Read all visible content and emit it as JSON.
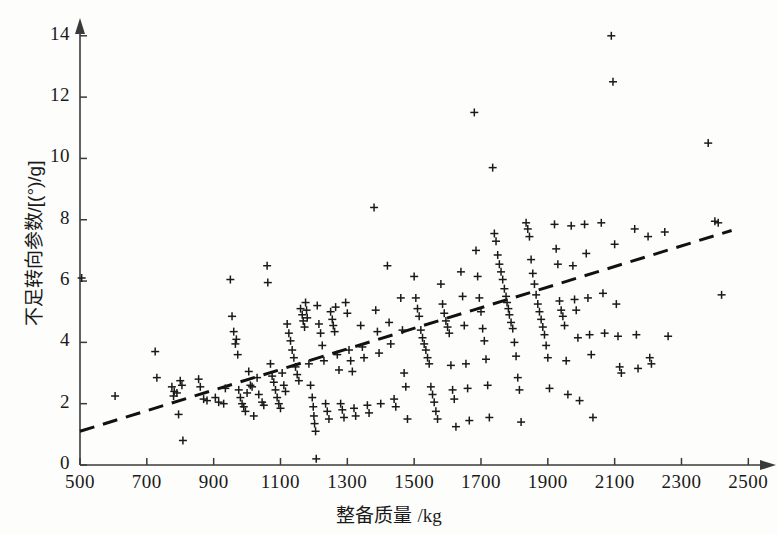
{
  "chart_data": {
    "type": "scatter",
    "title": "",
    "xlabel": "整备质量 /kg",
    "ylabel": "不足转向参数/[(°)/g]",
    "xlim": [
      500,
      2500
    ],
    "ylim": [
      0,
      14.6
    ],
    "xticks": [
      500,
      700,
      900,
      1100,
      1300,
      1500,
      1700,
      1900,
      2100,
      2300,
      2500
    ],
    "yticks": [
      0,
      2,
      4,
      6,
      8,
      10,
      12,
      14
    ],
    "xtick_labels": [
      "500",
      "700",
      "900",
      "1100",
      "1300",
      "1500",
      "1700",
      "1900",
      "2100",
      "2300",
      "2500"
    ],
    "ytick_labels": [
      "0",
      "2",
      "4",
      "6",
      "8",
      "10",
      "12",
      "14"
    ],
    "grid": false,
    "legend": null,
    "marker": "plus",
    "marker_color": "#1a1a1a",
    "axis_color": "#3a3a3a",
    "axis_arrows": true,
    "trendline": {
      "style": "dashed",
      "color": "#111111",
      "width": 3,
      "x": [
        500,
        2450
      ],
      "y": [
        1.1,
        7.65
      ]
    },
    "series": [
      {
        "name": "vehicles",
        "points": [
          [
            505,
            6.1
          ],
          [
            605,
            2.25
          ],
          [
            725,
            3.7
          ],
          [
            730,
            2.85
          ],
          [
            775,
            2.55
          ],
          [
            780,
            2.25
          ],
          [
            782,
            2.4
          ],
          [
            790,
            2.35
          ],
          [
            795,
            1.65
          ],
          [
            800,
            2.75
          ],
          [
            805,
            2.6
          ],
          [
            808,
            0.8
          ],
          [
            855,
            2.8
          ],
          [
            860,
            2.55
          ],
          [
            870,
            2.15
          ],
          [
            880,
            2.1
          ],
          [
            905,
            2.2
          ],
          [
            915,
            2.05
          ],
          [
            930,
            2.0
          ],
          [
            935,
            2.5
          ],
          [
            950,
            6.05
          ],
          [
            955,
            4.85
          ],
          [
            960,
            4.35
          ],
          [
            965,
            3.95
          ],
          [
            968,
            4.1
          ],
          [
            972,
            3.6
          ],
          [
            975,
            2.45
          ],
          [
            980,
            2.2
          ],
          [
            985,
            2.0
          ],
          [
            990,
            1.9
          ],
          [
            995,
            1.75
          ],
          [
            1000,
            2.35
          ],
          [
            1005,
            3.05
          ],
          [
            1010,
            2.6
          ],
          [
            1015,
            2.55
          ],
          [
            1020,
            1.6
          ],
          [
            1030,
            2.85
          ],
          [
            1035,
            2.3
          ],
          [
            1045,
            2.05
          ],
          [
            1050,
            1.95
          ],
          [
            1060,
            6.5
          ],
          [
            1062,
            5.95
          ],
          [
            1070,
            3.3
          ],
          [
            1075,
            2.9
          ],
          [
            1080,
            2.7
          ],
          [
            1085,
            2.45
          ],
          [
            1090,
            2.2
          ],
          [
            1095,
            2.0
          ],
          [
            1100,
            1.85
          ],
          [
            1105,
            3.0
          ],
          [
            1110,
            2.6
          ],
          [
            1115,
            2.4
          ],
          [
            1120,
            4.6
          ],
          [
            1125,
            4.3
          ],
          [
            1130,
            4.05
          ],
          [
            1135,
            3.75
          ],
          [
            1140,
            3.5
          ],
          [
            1145,
            3.2
          ],
          [
            1150,
            2.95
          ],
          [
            1155,
            2.75
          ],
          [
            1160,
            5.1
          ],
          [
            1165,
            4.9
          ],
          [
            1168,
            4.7
          ],
          [
            1172,
            4.5
          ],
          [
            1175,
            5.3
          ],
          [
            1178,
            5.05
          ],
          [
            1180,
            4.8
          ],
          [
            1185,
            3.3
          ],
          [
            1190,
            2.6
          ],
          [
            1195,
            2.2
          ],
          [
            1198,
            1.9
          ],
          [
            1200,
            1.6
          ],
          [
            1202,
            1.35
          ],
          [
            1205,
            1.1
          ],
          [
            1207,
            0.2
          ],
          [
            1210,
            5.2
          ],
          [
            1215,
            4.6
          ],
          [
            1220,
            4.3
          ],
          [
            1225,
            3.9
          ],
          [
            1230,
            3.4
          ],
          [
            1235,
            2.0
          ],
          [
            1240,
            1.75
          ],
          [
            1245,
            1.5
          ],
          [
            1250,
            5.0
          ],
          [
            1255,
            4.75
          ],
          [
            1258,
            4.55
          ],
          [
            1262,
            4.35
          ],
          [
            1265,
            5.15
          ],
          [
            1270,
            3.6
          ],
          [
            1275,
            3.1
          ],
          [
            1280,
            2.0
          ],
          [
            1285,
            1.8
          ],
          [
            1290,
            1.55
          ],
          [
            1295,
            5.3
          ],
          [
            1300,
            4.95
          ],
          [
            1305,
            3.75
          ],
          [
            1310,
            3.4
          ],
          [
            1315,
            3.05
          ],
          [
            1320,
            1.85
          ],
          [
            1325,
            1.6
          ],
          [
            1340,
            4.55
          ],
          [
            1345,
            3.85
          ],
          [
            1350,
            3.5
          ],
          [
            1360,
            1.95
          ],
          [
            1365,
            1.7
          ],
          [
            1380,
            8.4
          ],
          [
            1385,
            5.05
          ],
          [
            1390,
            4.35
          ],
          [
            1395,
            3.65
          ],
          [
            1400,
            2.0
          ],
          [
            1420,
            6.5
          ],
          [
            1425,
            4.65
          ],
          [
            1430,
            3.95
          ],
          [
            1440,
            2.15
          ],
          [
            1445,
            1.9
          ],
          [
            1460,
            5.45
          ],
          [
            1465,
            4.4
          ],
          [
            1470,
            3.0
          ],
          [
            1475,
            2.55
          ],
          [
            1480,
            1.5
          ],
          [
            1500,
            6.15
          ],
          [
            1505,
            5.45
          ],
          [
            1510,
            5.1
          ],
          [
            1515,
            4.85
          ],
          [
            1520,
            4.4
          ],
          [
            1525,
            4.15
          ],
          [
            1530,
            3.95
          ],
          [
            1535,
            3.75
          ],
          [
            1540,
            3.5
          ],
          [
            1545,
            3.3
          ],
          [
            1550,
            2.55
          ],
          [
            1555,
            2.3
          ],
          [
            1560,
            2.05
          ],
          [
            1565,
            1.75
          ],
          [
            1570,
            1.5
          ],
          [
            1580,
            5.9
          ],
          [
            1585,
            5.25
          ],
          [
            1590,
            4.95
          ],
          [
            1595,
            4.7
          ],
          [
            1600,
            4.5
          ],
          [
            1605,
            4.3
          ],
          [
            1610,
            3.25
          ],
          [
            1615,
            2.45
          ],
          [
            1620,
            2.15
          ],
          [
            1625,
            1.25
          ],
          [
            1640,
            6.3
          ],
          [
            1645,
            5.5
          ],
          [
            1650,
            4.55
          ],
          [
            1655,
            3.3
          ],
          [
            1660,
            2.5
          ],
          [
            1665,
            1.45
          ],
          [
            1680,
            11.5
          ],
          [
            1685,
            7.0
          ],
          [
            1690,
            6.15
          ],
          [
            1695,
            5.45
          ],
          [
            1700,
            5.0
          ],
          [
            1705,
            4.45
          ],
          [
            1710,
            4.05
          ],
          [
            1715,
            3.45
          ],
          [
            1720,
            2.6
          ],
          [
            1725,
            1.55
          ],
          [
            1735,
            9.7
          ],
          [
            1740,
            7.55
          ],
          [
            1745,
            7.3
          ],
          [
            1750,
            6.85
          ],
          [
            1755,
            6.55
          ],
          [
            1760,
            6.3
          ],
          [
            1765,
            6.05
          ],
          [
            1770,
            5.75
          ],
          [
            1775,
            5.5
          ],
          [
            1778,
            5.3
          ],
          [
            1782,
            5.1
          ],
          [
            1785,
            4.9
          ],
          [
            1790,
            4.65
          ],
          [
            1795,
            4.45
          ],
          [
            1800,
            4.0
          ],
          [
            1805,
            3.55
          ],
          [
            1810,
            2.85
          ],
          [
            1815,
            2.45
          ],
          [
            1820,
            1.4
          ],
          [
            1835,
            7.9
          ],
          [
            1840,
            7.7
          ],
          [
            1845,
            7.45
          ],
          [
            1850,
            6.7
          ],
          [
            1855,
            6.25
          ],
          [
            1860,
            5.9
          ],
          [
            1865,
            5.55
          ],
          [
            1870,
            5.25
          ],
          [
            1875,
            5.0
          ],
          [
            1880,
            4.75
          ],
          [
            1885,
            4.5
          ],
          [
            1890,
            4.25
          ],
          [
            1895,
            3.9
          ],
          [
            1900,
            3.5
          ],
          [
            1905,
            2.5
          ],
          [
            1920,
            7.85
          ],
          [
            1925,
            7.05
          ],
          [
            1930,
            6.55
          ],
          [
            1935,
            5.35
          ],
          [
            1940,
            5.05
          ],
          [
            1945,
            4.85
          ],
          [
            1950,
            4.55
          ],
          [
            1955,
            3.4
          ],
          [
            1960,
            2.3
          ],
          [
            1970,
            7.8
          ],
          [
            1975,
            6.5
          ],
          [
            1980,
            5.4
          ],
          [
            1985,
            5.05
          ],
          [
            1990,
            4.15
          ],
          [
            1995,
            2.1
          ],
          [
            2010,
            7.85
          ],
          [
            2015,
            6.9
          ],
          [
            2020,
            5.45
          ],
          [
            2025,
            4.25
          ],
          [
            2030,
            3.6
          ],
          [
            2035,
            1.55
          ],
          [
            2060,
            7.9
          ],
          [
            2065,
            5.6
          ],
          [
            2070,
            4.3
          ],
          [
            2090,
            14.0
          ],
          [
            2095,
            12.5
          ],
          [
            2100,
            7.2
          ],
          [
            2105,
            5.25
          ],
          [
            2110,
            4.2
          ],
          [
            2115,
            3.2
          ],
          [
            2120,
            3.0
          ],
          [
            2160,
            7.7
          ],
          [
            2165,
            4.25
          ],
          [
            2170,
            3.15
          ],
          [
            2200,
            7.45
          ],
          [
            2205,
            3.5
          ],
          [
            2210,
            3.3
          ],
          [
            2250,
            7.6
          ],
          [
            2260,
            4.2
          ],
          [
            2380,
            10.5
          ],
          [
            2400,
            7.95
          ],
          [
            2410,
            7.9
          ],
          [
            2420,
            5.55
          ]
        ]
      }
    ]
  },
  "axes": {
    "x_axis_name": "x-axis",
    "y_axis_name": "y-axis"
  }
}
